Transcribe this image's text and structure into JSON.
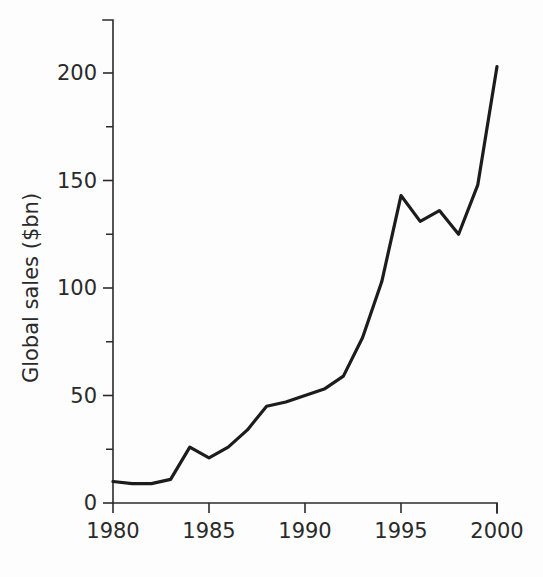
{
  "chart_data": {
    "type": "line",
    "title": "",
    "xlabel": "",
    "ylabel": "Global sales ($bn)",
    "x": [
      1980,
      1981,
      1982,
      1983,
      1984,
      1985,
      1986,
      1987,
      1988,
      1989,
      1990,
      1991,
      1992,
      1993,
      1994,
      1995,
      1996,
      1997,
      1998,
      1999,
      2000
    ],
    "values": [
      10,
      9,
      9,
      11,
      26,
      21,
      26,
      34,
      45,
      47,
      50,
      53,
      59,
      77,
      103,
      143,
      131,
      136,
      125,
      148,
      203
    ],
    "series": [
      {
        "name": "Global sales",
        "values": [
          10,
          9,
          9,
          11,
          26,
          21,
          26,
          34,
          45,
          47,
          50,
          53,
          59,
          77,
          103,
          143,
          131,
          136,
          125,
          148,
          203
        ]
      }
    ],
    "xlim": [
      1980,
      2000
    ],
    "ylim": [
      0,
      215
    ],
    "x_tick_labels": [
      "1980",
      "1985",
      "1990",
      "1995",
      "2000"
    ],
    "x_tick_values": [
      1980,
      1985,
      1990,
      1995,
      2000
    ],
    "y_tick_labels": [
      "0",
      "50",
      "100",
      "150",
      "200"
    ],
    "y_tick_values": [
      0,
      50,
      100,
      150,
      200
    ],
    "y_minor_tick_values": [
      25,
      75,
      125,
      175
    ],
    "grid": false,
    "legend": false,
    "legend_position": "none",
    "line_color": "#1c1c1c",
    "axis_color": "#2b2b2b",
    "background_color": "#fdfdfd"
  }
}
